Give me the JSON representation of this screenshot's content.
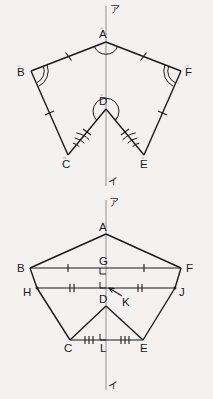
{
  "page": {
    "background_color": "#f3f2f0",
    "ink_color": "#1b1b1b",
    "axis_color": "#8a8a8a",
    "width": 213,
    "height": 399
  },
  "figures": [
    {
      "id": "figure-top",
      "name": "reflex-hexagon-with-axis",
      "axis": {
        "top_label": "ア",
        "bottom_label": "イ",
        "x": 106,
        "y_top": 6,
        "y_bottom": 186
      },
      "vertices": [
        {
          "key": "A",
          "label": "A",
          "x": 106,
          "y": 42,
          "label_x": 99,
          "label_y": 38,
          "mark": "≂"
        },
        {
          "key": "B",
          "label": "B",
          "x": 31,
          "y": 71,
          "label_x": 17,
          "label_y": 76,
          "mark": "≂"
        },
        {
          "key": "F",
          "label": "F",
          "x": 181,
          "y": 71,
          "label_x": 185,
          "label_y": 76,
          "mark": "≂"
        },
        {
          "key": "C",
          "label": "C",
          "x": 68,
          "y": 155,
          "label_x": 62,
          "label_y": 168,
          "mark": "≂"
        },
        {
          "key": "E",
          "label": "E",
          "x": 144,
          "y": 155,
          "label_x": 140,
          "label_y": 168,
          "mark": "≂"
        },
        {
          "key": "D",
          "label": "D",
          "x": 106,
          "y": 109,
          "label_x": 99,
          "label_y": 105,
          "mark": "≂"
        }
      ],
      "edges": [
        {
          "from": "B",
          "to": "A",
          "ticks": 1
        },
        {
          "from": "A",
          "to": "F",
          "ticks": 1
        },
        {
          "from": "B",
          "to": "C",
          "ticks": 1
        },
        {
          "from": "F",
          "to": "E",
          "ticks": 1
        },
        {
          "from": "C",
          "to": "D",
          "ticks": 1
        },
        {
          "from": "E",
          "to": "D",
          "ticks": 1
        }
      ],
      "angle_arcs": [
        {
          "at": "A",
          "arcs": 1
        },
        {
          "at": "B",
          "arcs": 2
        },
        {
          "at": "F",
          "arcs": 2
        },
        {
          "at": "C",
          "arcs": 3
        },
        {
          "at": "E",
          "arcs": 3
        },
        {
          "at": "D",
          "arcs": 1,
          "reflex": true
        }
      ]
    },
    {
      "id": "figure-bottom",
      "name": "hexagon-with-midlines-and-axis",
      "axis": {
        "top_label": "ア",
        "bottom_label": "イ",
        "x": 106,
        "y_top": 200,
        "y_bottom": 390
      },
      "vertices": [
        {
          "key": "A",
          "label": "A",
          "x": 106,
          "y": 234,
          "label_x": 99,
          "label_y": 231
        },
        {
          "key": "B",
          "label": "B",
          "x": 30,
          "y": 268,
          "label_x": 17,
          "label_y": 272
        },
        {
          "key": "F",
          "label": "F",
          "x": 181,
          "y": 268,
          "label_x": 186,
          "label_y": 272
        },
        {
          "key": "H",
          "label": "H",
          "x": 37,
          "y": 288,
          "label_x": 23,
          "label_y": 296
        },
        {
          "key": "J",
          "label": "J",
          "x": 175,
          "y": 288,
          "label_x": 179,
          "label_y": 296
        },
        {
          "key": "C",
          "label": "C",
          "x": 70,
          "y": 340,
          "label_x": 64,
          "label_y": 352
        },
        {
          "key": "E",
          "label": "E",
          "x": 143,
          "y": 340,
          "label_x": 140,
          "label_y": 352
        },
        {
          "key": "D",
          "label": "D",
          "x": 106,
          "y": 306,
          "label_x": 99,
          "label_y": 303
        },
        {
          "key": "G",
          "label": "G",
          "x": 106,
          "y": 268,
          "label_x": 99,
          "label_y": 265
        },
        {
          "key": "K",
          "label": "K",
          "x": 124,
          "y": 298,
          "label_x": 120,
          "label_y": 305
        },
        {
          "key": "L",
          "label": "L",
          "x": 106,
          "y": 340,
          "label_x": 100,
          "label_y": 352
        }
      ],
      "edges": [
        {
          "from": "B",
          "to": "A",
          "ticks": 0
        },
        {
          "from": "A",
          "to": "F",
          "ticks": 0
        },
        {
          "from": "B",
          "to": "H",
          "ticks": 0
        },
        {
          "from": "F",
          "to": "J",
          "ticks": 0
        },
        {
          "from": "H",
          "to": "C",
          "ticks": 0
        },
        {
          "from": "J",
          "to": "E",
          "ticks": 0
        },
        {
          "from": "C",
          "to": "D",
          "ticks": 0
        },
        {
          "from": "E",
          "to": "D",
          "ticks": 0
        },
        {
          "from": "C",
          "to": "E",
          "ticks": 0
        }
      ],
      "chords": [
        {
          "name": "BF",
          "from": "B",
          "to": "F",
          "ticks": 1,
          "through": "G"
        },
        {
          "name": "HJ",
          "from": "H",
          "to": "J",
          "ticks": 2,
          "through": "K"
        },
        {
          "name": "CE",
          "from": "C",
          "to": "E",
          "ticks": 3,
          "through": "L"
        }
      ],
      "right_angles": [
        {
          "at": "G",
          "label": "right-angle-at-g"
        },
        {
          "at": "K",
          "label": "right-angle-at-k"
        },
        {
          "at": "L",
          "label": "right-angle-at-l"
        }
      ],
      "pointer": {
        "name": "k-pointer-arrow",
        "from_x": 122,
        "from_y": 296,
        "to_x": 108,
        "to_y": 287
      }
    }
  ]
}
